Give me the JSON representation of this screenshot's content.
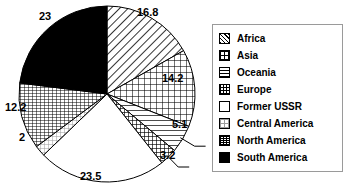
{
  "chart_data": {
    "type": "pie",
    "title": "",
    "xlabel": "",
    "ylabel": "",
    "legend_position": "right",
    "grid": false,
    "start_angle_deg": 0,
    "direction": "clockwise",
    "categories": [
      "Africa",
      "Asia",
      "Oceania",
      "Europe",
      "Former USSR",
      "Central America",
      "North America",
      "South America"
    ],
    "values": [
      16.8,
      14.2,
      5.1,
      3.2,
      23.5,
      2,
      12.2,
      23
    ],
    "labels": [
      "16.8",
      "14.2",
      "5.1",
      "3.2",
      "23.5",
      "2",
      "12.2",
      "23"
    ],
    "total": 100,
    "slices": [
      {
        "name": "Africa",
        "value": 16.8,
        "label": "16.8",
        "pattern": "diagonal-hatch",
        "fill": "#ffffff",
        "ink": "#000000",
        "leader": false
      },
      {
        "name": "Asia",
        "value": 14.2,
        "label": "14.2",
        "pattern": "crosshatch-grid",
        "fill": "#ffffff",
        "ink": "#000000",
        "leader": false
      },
      {
        "name": "Oceania",
        "value": 5.1,
        "label": "5.1",
        "pattern": "horizontal-lines",
        "fill": "#ffffff",
        "ink": "#000000",
        "leader": true
      },
      {
        "name": "Europe",
        "value": 3.2,
        "label": "3.2",
        "pattern": "dense-crosshatch",
        "fill": "#ffffff",
        "ink": "#000000",
        "leader": true
      },
      {
        "name": "Former USSR",
        "value": 23.5,
        "label": "23.5",
        "pattern": "empty-white",
        "fill": "#ffffff",
        "ink": "#000000",
        "leader": false
      },
      {
        "name": "Central America",
        "value": 2,
        "label": "2",
        "pattern": "light-grid",
        "fill": "#ffffff",
        "ink": "#9a9a9a",
        "leader": false
      },
      {
        "name": "North America",
        "value": 12.2,
        "label": "12.2",
        "pattern": "fine-grid",
        "fill": "#ffffff",
        "ink": "#000000",
        "leader": false
      },
      {
        "name": "South America",
        "value": 23,
        "label": "23",
        "pattern": "solid-black",
        "fill": "#000000",
        "ink": "#000000",
        "leader": false
      }
    ]
  },
  "legend": {
    "border_color": "#9a9a9a",
    "items": [
      {
        "label": "Africa",
        "swatch": "diagonal-hatch"
      },
      {
        "label": "Asia",
        "swatch": "crosshatch-grid"
      },
      {
        "label": "Oceania",
        "swatch": "horizontal-lines"
      },
      {
        "label": "Europe",
        "swatch": "dense-crosshatch"
      },
      {
        "label": "Former USSR",
        "swatch": "empty-white"
      },
      {
        "label": "Central America",
        "swatch": "light-grid"
      },
      {
        "label": "North America",
        "swatch": "fine-grid"
      },
      {
        "label": "South America",
        "swatch": "solid-black"
      }
    ]
  }
}
